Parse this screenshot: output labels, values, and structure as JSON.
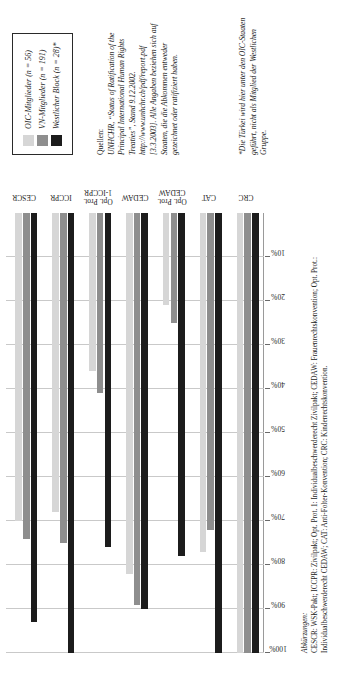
{
  "figure": {
    "legend": {
      "items": [
        {
          "label": "OIC-Mitglieder (n = 56)",
          "color": "#d6d6d6",
          "key": "oic"
        },
        {
          "label": "VN-Mitglieder (n = 191)",
          "color": "#8e8e8e",
          "key": "vn"
        },
        {
          "label": "Westlicher Block (n = 28)*",
          "color": "#1c1c1c",
          "key": "west"
        }
      ]
    },
    "source": {
      "lead": "Quellen:",
      "text": "UNHCHR, “Status of Ratification of the Principal International Human Rights Treaties”, Stand 9.12.2002. http://www.unhchr.ch/pdf/report.pdf [3.3.2003]. Alle Angaben beziehen sich auf Staaten, die die Abkommen entweder gezeichnet oder ratifiziert haben."
    },
    "footnote": {
      "text": "*Die Türkei wird hier unter den OIC-Staaten geführt, nicht als Mitglied der Westlichen Gruppe."
    },
    "abbreviations": {
      "lead": "Abkürzungen:",
      "text": "CESCR: WSK-Pakt; ICCPR: Zivilpakt; Opt. Prot. 1: Individualbeschwerderecht Zivilpakt; CEDAW: Frauenrechtskonvention; Opt. Prot.: Individualbeschwerderecht CEDAW; CAT: Anti-Folter-Konvention; CRC: Kinderrechtskonvention."
    }
  },
  "chart_data": {
    "type": "bar",
    "orientation": "horizontal",
    "title": "",
    "xlabel": "",
    "ylabel": "",
    "ylim": [
      0,
      100
    ],
    "grid": true,
    "legend_position": "right",
    "tick_labels": [
      "100%",
      "90%",
      "80%",
      "70%",
      "60%",
      "50%",
      "40%",
      "30%",
      "20%",
      "10%"
    ],
    "tick_values": [
      100,
      90,
      80,
      70,
      60,
      50,
      40,
      30,
      20,
      10
    ],
    "categories": [
      "CESCR",
      "ICCPR",
      "Opt. Prot.\n1-ICCPR",
      "CEDAW",
      "Opt. Prot.\nCEDAW",
      "CAT",
      "CRC"
    ],
    "series": [
      {
        "name": "OIC-Mitglieder (n = 56)",
        "color": "#d6d6d6",
        "values": [
          70,
          68,
          36,
          82,
          21,
          77,
          100
        ]
      },
      {
        "name": "VN-Mitglieder (n = 191)",
        "color": "#8e8e8e",
        "values": [
          74,
          75,
          41,
          89,
          25,
          72,
          100
        ]
      },
      {
        "name": "Westlicher Block (n = 28)*",
        "color": "#1c1c1c",
        "values": [
          93,
          100,
          76,
          90,
          78,
          100,
          100
        ]
      }
    ]
  }
}
